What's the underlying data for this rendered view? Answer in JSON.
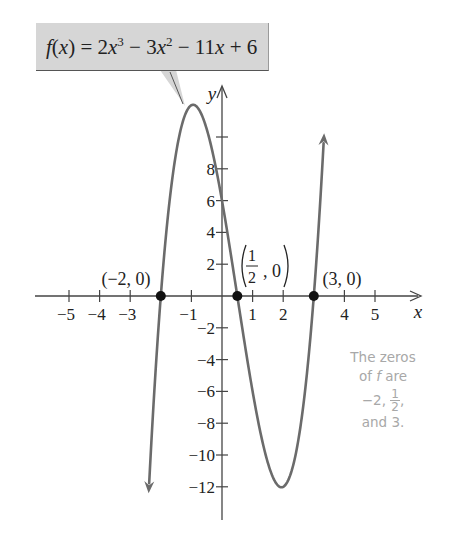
{
  "callout": {
    "label": "f(x) = 2x^3 - 3x^2 - 11x + 6",
    "parts": {
      "f": "f",
      "open": "(",
      "x": "x",
      "close": ")",
      "eq": " = 2",
      "x1": "x",
      "exp3": "3",
      "minus3": " − 3",
      "x2": "x",
      "exp2": "2",
      "minus11": " − 11",
      "x3": "x",
      "plus6": " + 6"
    }
  },
  "note": {
    "line1": "The zeros",
    "line2_pre": "of ",
    "line2_f": "f",
    "line2_post": " are",
    "line3_pre": "−2, ",
    "frac_num": "1",
    "frac_den": "2",
    "line3_post": ",",
    "line4": "and 3."
  },
  "colors": {
    "curve": "#6b6b6b",
    "axis": "#444444",
    "point": "#111111",
    "callout_bg": "#d6d6d6",
    "note_text": "#a8a8a8"
  },
  "chart_data": {
    "type": "line",
    "xlabel": "x",
    "ylabel": "y",
    "xlim": [
      -5.5,
      6
    ],
    "ylim": [
      -14,
      12.5
    ],
    "x_ticks": [
      -5,
      -4,
      -3,
      -2,
      -1,
      1,
      2,
      3,
      4,
      5
    ],
    "x_tick_labels": [
      "−5",
      "−4",
      "−3",
      "",
      "−1",
      "1",
      "2",
      "",
      "4",
      "5"
    ],
    "y_ticks": [
      -12,
      -10,
      -8,
      -6,
      -4,
      -2,
      2,
      4,
      6,
      8,
      10
    ],
    "y_tick_labels": [
      "−12",
      "−10",
      "−8",
      "−6",
      "−4",
      "−2",
      "2",
      "4",
      "6",
      "8",
      ""
    ],
    "grid": false,
    "series": [
      {
        "name": "f(x) = 2x^3 - 3x^2 - 11x + 6",
        "function": "2x^3 - 3x^2 - 11x + 6",
        "x": [
          -2.4,
          -2,
          -1.5,
          -1,
          -0.5,
          0,
          0.5,
          1,
          1.5,
          2,
          2.5,
          3,
          3.3
        ],
        "values": [
          -13.32,
          0,
          9.75,
          12,
          10.5,
          6,
          0,
          -6,
          -10.5,
          -12,
          -9,
          0,
          9.69
        ]
      }
    ],
    "marked_points": [
      {
        "x": -2,
        "y": 0,
        "label": "(−2, 0)"
      },
      {
        "x": 0.5,
        "y": 0,
        "label": "(1/2, 0)"
      },
      {
        "x": 3,
        "y": 0,
        "label": "(3, 0)"
      }
    ],
    "extrema": [
      {
        "x": -1,
        "y": 12,
        "type": "local max"
      },
      {
        "x": 2,
        "y": -12,
        "type": "local min"
      }
    ],
    "annotations": [
      "The zeros of f are −2, 1/2, and 3."
    ]
  }
}
